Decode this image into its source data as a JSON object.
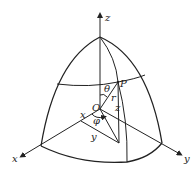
{
  "figure": {
    "labels": {
      "z_axis": "z",
      "x_axis": "x",
      "y_axis": "y",
      "point": "P",
      "origin": "O",
      "theta": "θ",
      "phi": "φ",
      "radius": "r",
      "z_component": "z",
      "x_component": "x",
      "y_component": "y"
    },
    "colors": {
      "stroke": "#222222",
      "background": "#ffffff"
    }
  }
}
